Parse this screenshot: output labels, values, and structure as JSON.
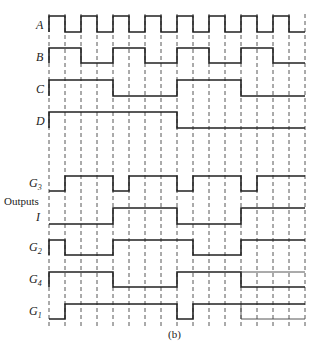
{
  "figure": {
    "caption": "(b)",
    "outputs_label": "Outputs",
    "grid": {
      "x0": 49,
      "step": 16,
      "intervals": 16,
      "y_top": 14,
      "y_bottom": 326
    },
    "colors": {
      "line": "#222222",
      "grid": "#444444",
      "background": "#ffffff"
    }
  },
  "signals": [
    {
      "id": "A",
      "label": "A",
      "sub": "",
      "y_high": 16,
      "y_low": 32,
      "label_y": 29,
      "levels": [
        1,
        0,
        1,
        0,
        1,
        0,
        1,
        0,
        1,
        0,
        1,
        0,
        1,
        0,
        1,
        0
      ]
    },
    {
      "id": "B",
      "label": "B",
      "sub": "",
      "y_high": 48,
      "y_low": 63,
      "label_y": 61,
      "levels": [
        1,
        1,
        0,
        0,
        1,
        1,
        0,
        0,
        1,
        1,
        0,
        0,
        1,
        1,
        0,
        0
      ]
    },
    {
      "id": "C",
      "label": "C",
      "sub": "",
      "y_high": 80,
      "y_low": 96,
      "label_y": 93,
      "levels": [
        1,
        1,
        1,
        1,
        0,
        0,
        0,
        0,
        1,
        1,
        1,
        1,
        0,
        0,
        0,
        0
      ]
    },
    {
      "id": "D",
      "label": "D",
      "sub": "",
      "y_high": 112,
      "y_low": 128,
      "label_y": 125,
      "levels": [
        1,
        1,
        1,
        1,
        1,
        1,
        1,
        1,
        0,
        0,
        0,
        0,
        0,
        0,
        0,
        0
      ]
    },
    {
      "id": "G3",
      "label": "G",
      "sub": "3",
      "y_high": 176,
      "y_low": 191,
      "label_y": 187,
      "levels": [
        0,
        1,
        1,
        1,
        0,
        1,
        1,
        1,
        0,
        1,
        1,
        1,
        0,
        1,
        1,
        1
      ]
    },
    {
      "id": "I",
      "label": "I",
      "sub": "",
      "y_high": 208,
      "y_low": 224,
      "label_y": 221,
      "levels": [
        0,
        0,
        0,
        0,
        1,
        1,
        1,
        1,
        0,
        0,
        0,
        0,
        1,
        1,
        1,
        1
      ]
    },
    {
      "id": "G2",
      "label": "G",
      "sub": "2",
      "y_high": 240,
      "y_low": 255,
      "label_y": 251,
      "levels": [
        1,
        0,
        0,
        0,
        1,
        1,
        1,
        1,
        1,
        0,
        0,
        0,
        1,
        1,
        1,
        1
      ]
    },
    {
      "id": "G4",
      "label": "G",
      "sub": "4",
      "y_high": 272,
      "y_low": 287,
      "label_y": 283,
      "levels": [
        1,
        1,
        1,
        1,
        0,
        0,
        0,
        0,
        1,
        1,
        1,
        1,
        0,
        0,
        0,
        0
      ]
    },
    {
      "id": "G1",
      "label": "G",
      "sub": "1",
      "y_high": 304,
      "y_low": 319,
      "label_y": 315,
      "levels": [
        0,
        1,
        1,
        1,
        1,
        1,
        1,
        1,
        0,
        1,
        1,
        1,
        1,
        1,
        1,
        1
      ]
    }
  ]
}
